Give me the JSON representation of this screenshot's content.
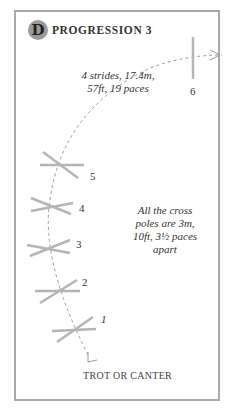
{
  "header": {
    "badge": "D",
    "title": "PROGRESSION 3"
  },
  "annotations": {
    "strides_line1": "4 strides, 17.4m,",
    "strides_line2": "57ft, 19 paces",
    "spacing_line1": "All the cross",
    "spacing_line2": "poles are 3m,",
    "spacing_line3": "10ft, 3½ paces",
    "spacing_line4": "apart"
  },
  "poles": [
    {
      "label": "1"
    },
    {
      "label": "2"
    },
    {
      "label": "3"
    },
    {
      "label": "4"
    },
    {
      "label": "5"
    },
    {
      "label": "6"
    }
  ],
  "footer": {
    "gait": "TROT OR CANTER"
  },
  "colors": {
    "pole": "#b5b5b5",
    "frame": "#a9a9a9",
    "path": "#9a9a9a",
    "text": "#333333"
  }
}
